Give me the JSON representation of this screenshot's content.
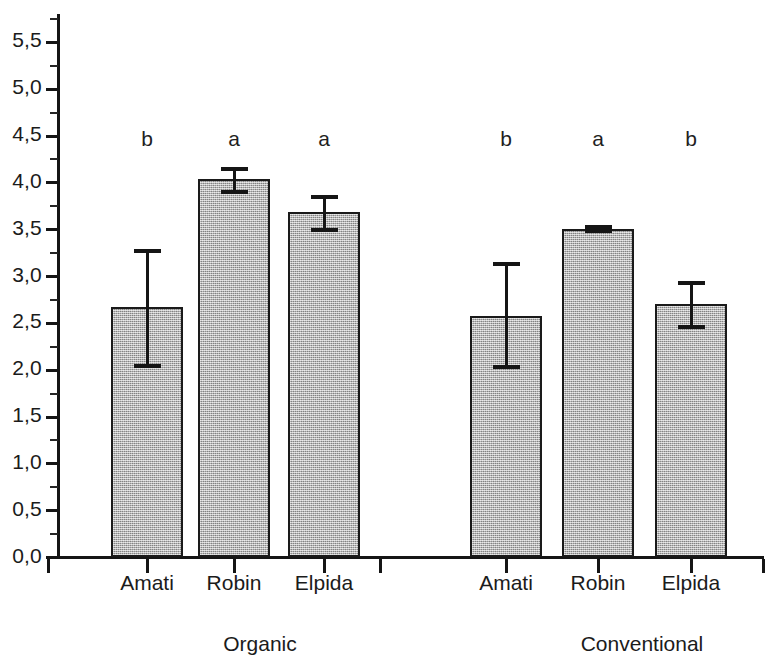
{
  "chart_data": {
    "type": "bar",
    "title": "",
    "subtitle": "",
    "xlabel": "",
    "ylabel": "",
    "ylim": [
      0.0,
      5.75
    ],
    "grid": false,
    "legend": "none",
    "decimal_separator": ",",
    "y_ticks_major": [
      "0,0",
      "0,5",
      "1,0",
      "1,5",
      "2,0",
      "2,5",
      "3,0",
      "3,5",
      "4,0",
      "4,5",
      "5,0",
      "5,5"
    ],
    "y_tick_values": [
      0.0,
      0.5,
      1.0,
      1.5,
      2.0,
      2.5,
      3.0,
      3.5,
      4.0,
      4.5,
      5.0,
      5.5
    ],
    "y_minor_tick_values": [
      0.25,
      0.75,
      1.25,
      1.75,
      2.25,
      2.75,
      3.25,
      3.75,
      4.25,
      4.75,
      5.25,
      5.75
    ],
    "groups": [
      "Organic",
      "Conventional"
    ],
    "categories": [
      "Amati",
      "Robin",
      "Elpida"
    ],
    "bars": [
      {
        "group": "Organic",
        "category": "Amati",
        "value": 2.67,
        "err_low": 2.04,
        "err_high": 3.27,
        "letter": "b"
      },
      {
        "group": "Organic",
        "category": "Robin",
        "value": 4.04,
        "err_low": 3.9,
        "err_high": 4.15,
        "letter": "a"
      },
      {
        "group": "Organic",
        "category": "Elpida",
        "value": 3.69,
        "err_low": 3.5,
        "err_high": 3.85,
        "letter": "a"
      },
      {
        "group": "Conventional",
        "category": "Amati",
        "value": 2.58,
        "err_low": 2.03,
        "err_high": 3.13,
        "letter": "b"
      },
      {
        "group": "Conventional",
        "category": "Robin",
        "value": 3.51,
        "err_low": 3.49,
        "err_high": 3.53,
        "letter": "a"
      },
      {
        "group": "Conventional",
        "category": "Elpida",
        "value": 2.71,
        "err_low": 2.46,
        "err_high": 2.93,
        "letter": "b"
      }
    ],
    "colors": {
      "bar_fill": "#b2b2b2",
      "bar_border": "#1a1a1a",
      "axis": "#151515",
      "text": "#1b1b1b",
      "background": "#ffffff"
    }
  }
}
